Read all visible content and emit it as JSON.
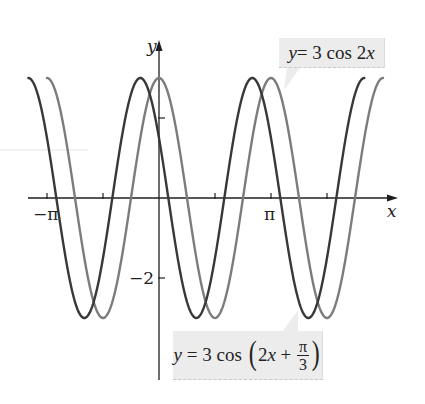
{
  "chart_data": {
    "type": "line",
    "title": "",
    "xlabel": "x",
    "ylabel": "y",
    "x_tick_labels": [
      {
        "value": -3.14159,
        "label": "−π"
      },
      {
        "value": 3.14159,
        "label": "π"
      }
    ],
    "x_ticks_unlabeled": [
      -1.5708,
      1.5708,
      4.7124
    ],
    "y_tick_labels": [
      {
        "value": -2,
        "label": "−2"
      }
    ],
    "y_ticks_unlabeled": [
      2
    ],
    "xlim": [
      -3.67,
      6.63
    ],
    "ylim": [
      -4.55,
      4.0
    ],
    "grid": false,
    "legend": "callouts",
    "series": [
      {
        "name": "y = 3 cos 2x",
        "expression": "3*cos(2*x)",
        "amplitude": 3,
        "frequency": 2,
        "phase": 0,
        "x_range": [
          -3.14159,
          6.28319
        ],
        "color": "#7c7c7c"
      },
      {
        "name": "y = 3 cos (2x + π/3)",
        "expression": "3*cos(2*x + pi/3)",
        "amplitude": 3,
        "frequency": 2,
        "phase": 1.0472,
        "x_range": [
          -3.66519,
          5.75959
        ],
        "color": "#383838"
      }
    ],
    "annotations": [
      {
        "text": "y = 3 cos 2x",
        "points_to_series": 0
      },
      {
        "text": "y = 3 cos (2x + π/3)",
        "points_to_series": 1
      }
    ]
  },
  "labels": {
    "x_axis": "x",
    "y_axis": "y",
    "tick_neg_pi": "−π",
    "tick_pi": "π",
    "tick_neg_2": "−2"
  },
  "callouts": {
    "top": {
      "y": "y",
      "eq": " = 3 cos 2",
      "x": "x"
    },
    "bottom": {
      "y": "y",
      "eq": " = 3 cos ",
      "lparen": "(",
      "two": "2",
      "x": "x",
      "plus": " + ",
      "num": "π",
      "den": "3",
      "rparen": ")"
    }
  },
  "colors": {
    "axis": "#1e1e1e",
    "curve_base": "#7c7c7c",
    "curve_shifted": "#383838",
    "callout_bg": "#ececec"
  }
}
